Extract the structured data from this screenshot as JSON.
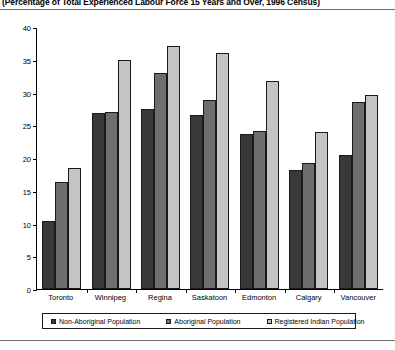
{
  "title": "(Percentage of Total Experienced Labour Force 15 Years and Over, 1996 Census)",
  "chart_data": {
    "type": "bar",
    "title": "(Percentage of Total Experienced Labour Force 15 Years and Over, 1996 Census)",
    "xlabel": "",
    "ylabel": "",
    "ylim": [
      0,
      40
    ],
    "yticks": [
      "0",
      "5",
      "10",
      "15",
      "20",
      "25",
      "30",
      "35",
      "40"
    ],
    "ytick_values": [
      0,
      5,
      10,
      15,
      20,
      25,
      30,
      35,
      40
    ],
    "grid": false,
    "legend_position": "bottom",
    "categories": [
      "Toronto",
      "Winnipeg",
      "Regina",
      "Saskatoon",
      "Edmonton",
      "Calgary",
      "Vancouver"
    ],
    "series": [
      {
        "name": "Non-Aboriginal Population",
        "color": "#393939",
        "values": [
          10.4,
          26.8,
          27.5,
          26.5,
          23.7,
          18.2,
          20.5
        ]
      },
      {
        "name": "Aboriginal Population",
        "color": "#6e6e6e",
        "values": [
          16.4,
          27.0,
          33.0,
          28.9,
          24.1,
          19.3,
          28.6
        ]
      },
      {
        "name": "Registered Indian Population",
        "color": "#c4c4c4",
        "values": [
          18.5,
          35.0,
          37.1,
          36.0,
          31.8,
          24.0,
          29.6
        ]
      }
    ]
  }
}
